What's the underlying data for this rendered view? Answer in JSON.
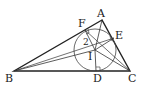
{
  "diagram": {
    "type": "triangle-incircle",
    "points": {
      "A": {
        "label": "A",
        "x": 102,
        "y": 20
      },
      "B": {
        "label": "B",
        "x": 14,
        "y": 71
      },
      "C": {
        "label": "C",
        "x": 130,
        "y": 71
      },
      "D": {
        "label": "D",
        "x": 96,
        "y": 71
      },
      "E": {
        "label": "E",
        "x": 114,
        "y": 38
      },
      "F": {
        "label": "F",
        "x": 85,
        "y": 30
      },
      "I": {
        "label": "I",
        "x": 95,
        "y": 50
      }
    },
    "incircle": {
      "center": "I",
      "radius": 21
    },
    "angle_labels": {
      "one": "1",
      "two": "2"
    },
    "right_angle_marks": [
      "D",
      "E",
      "F"
    ],
    "stroke_color": "#222222"
  }
}
